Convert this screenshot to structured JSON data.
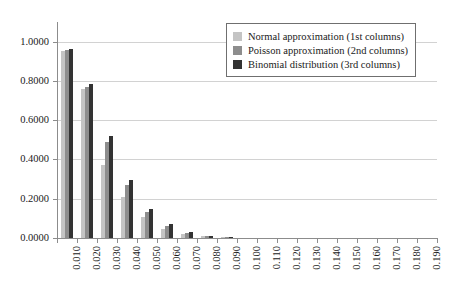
{
  "chart_data": {
    "type": "bar",
    "title": "",
    "subtitle": "",
    "xlabel": "",
    "ylabel": "",
    "grid": true,
    "legend_position": "top-right",
    "ylim": [
      0.0,
      1.1
    ],
    "ytick_labels": [
      "0.0000",
      "0.2000",
      "0.4000",
      "0.6000",
      "0.8000",
      "1.0000"
    ],
    "ytick_values": [
      0.0,
      0.2,
      0.4,
      0.6,
      0.8,
      1.0
    ],
    "categories": [
      "0.010",
      "0.020",
      "0.030",
      "0.040",
      "0.050",
      "0.060",
      "0.070",
      "0.080",
      "0.090",
      "0.100",
      "0.110",
      "0.120",
      "0.130",
      "0.140",
      "0.150",
      "0.160",
      "0.170",
      "0.180",
      "0.190"
    ],
    "series": [
      {
        "name": "Normal approximation (1st columns)",
        "color": "#c4c4c4",
        "values": [
          0.95,
          0.76,
          0.37,
          0.21,
          0.105,
          0.048,
          0.02,
          0.008,
          0.003,
          0.001,
          0.0003,
          0.0001,
          0.0,
          0.0,
          0.0,
          0.0,
          0.0,
          0.0,
          0.0
        ]
      },
      {
        "name": "Poisson approximation (2nd columns)",
        "color": "#8d8d8d",
        "values": [
          0.956,
          0.77,
          0.49,
          0.27,
          0.135,
          0.062,
          0.028,
          0.011,
          0.0045,
          0.0015,
          0.0005,
          0.0002,
          0.0,
          0.0,
          0.0,
          0.0,
          0.0,
          0.0,
          0.0
        ]
      },
      {
        "name": "Binomial distribution (3rd columns)",
        "color": "#333333",
        "values": [
          0.965,
          0.782,
          0.52,
          0.295,
          0.148,
          0.07,
          0.031,
          0.012,
          0.005,
          0.0018,
          0.0006,
          0.0002,
          0.0,
          0.0,
          0.0,
          0.0,
          0.0,
          0.0,
          0.0
        ]
      }
    ]
  },
  "legend": {
    "items": [
      {
        "label": "Normal approximation (1st columns)"
      },
      {
        "label": "Poisson approximation (2nd columns)"
      },
      {
        "label": "Binomial distribution (3rd columns)"
      }
    ]
  }
}
